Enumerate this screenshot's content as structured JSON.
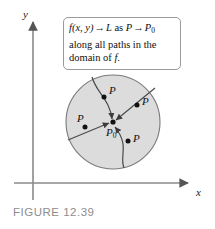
{
  "figure": {
    "caption": "FIGURE 12.39",
    "caption_color": "#8d8d8d",
    "background": "#ffffff"
  },
  "axes": {
    "y_label": "y",
    "x_label": "x",
    "color": "#808080",
    "origin": {
      "x": 33,
      "y": 183
    },
    "y_top": 18,
    "x_right": 193
  },
  "callout": {
    "line1": {
      "function": "f(x, y)",
      "arrow1": "→",
      "limit": "L",
      "as": "as",
      "point": "P",
      "arrow2": "→",
      "point0": "P",
      "point0_sub": "0"
    },
    "line2": "along all paths in the",
    "line3_pre": "domain of ",
    "line3_f": "f.",
    "border_color": "#9a9a9a",
    "fill": "#ffffff"
  },
  "disk": {
    "center": {
      "x": 113,
      "y": 122
    },
    "radius": 47,
    "fill": "#dcdcdc",
    "stroke": "#7a7a7a",
    "label_center": "P",
    "label_center_sub": "0"
  },
  "points": [
    {
      "name": "point-top",
      "label": "P",
      "dot": {
        "x": 104,
        "y": 97
      },
      "label_pos": {
        "x": 109,
        "y": 90
      }
    },
    {
      "name": "point-upper-right",
      "label": "P",
      "dot": {
        "x": 137,
        "y": 105
      },
      "label_pos": {
        "x": 142,
        "y": 100
      }
    },
    {
      "name": "point-left",
      "label": "P",
      "dot": {
        "x": 85,
        "y": 127
      },
      "label_pos": {
        "x": 79,
        "y": 116
      }
    },
    {
      "name": "point-lower-right",
      "label": "P",
      "dot": {
        "x": 128,
        "y": 141
      },
      "label_pos": {
        "x": 133,
        "y": 136
      }
    }
  ],
  "paths": [
    {
      "name": "path-curve-top",
      "style": "curve"
    },
    {
      "name": "path-straight-upper-right",
      "style": "straight"
    },
    {
      "name": "path-straight-left",
      "style": "straight"
    },
    {
      "name": "path-curve-bottom",
      "style": "curve"
    }
  ]
}
